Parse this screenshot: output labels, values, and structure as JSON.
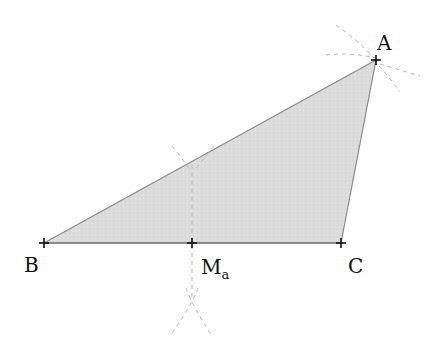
{
  "diagram": {
    "colors": {
      "fill": "#d9d9d9",
      "edge": "#8a8a8a",
      "marker": "#111111",
      "construction": "#b5b5b5",
      "label": "#111111"
    },
    "points": {
      "A": {
        "label": "A",
        "x": 376,
        "y": 60
      },
      "B": {
        "label": "B",
        "x": 44,
        "y": 243
      },
      "C": {
        "label": "C",
        "x": 341,
        "y": 243
      },
      "Ma": {
        "label": "M",
        "subscript": "a",
        "x": 192,
        "y": 243
      }
    },
    "labels": {
      "A": "A",
      "B": "B",
      "C": "C",
      "Ma_main": "M",
      "Ma_sub": "a"
    }
  }
}
